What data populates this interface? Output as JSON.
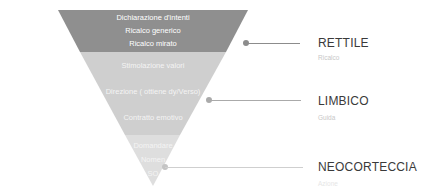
{
  "funnel": {
    "colors": {
      "top": "#8f8f8f",
      "middle": "#cfcfcf",
      "bottom": "#e2e2e2"
    },
    "top_items": [
      "Dichiarazione d'intenti",
      "Ricalco generico",
      "Ricalco mirato"
    ],
    "middle_items": [
      "Stimolazione valori",
      "Direzione ( ottiene dy/Verso)",
      "Contratto emotivo"
    ],
    "bottom_items": [
      "Domandare",
      "Nomen",
      "SO"
    ]
  },
  "layers": [
    {
      "title": "RETTILE",
      "subtitle": "Ricalco"
    },
    {
      "title": "LIMBICO",
      "subtitle": "Guida"
    },
    {
      "title": "NEOCORTECCIA",
      "subtitle": "Azione"
    }
  ],
  "connector_color": "#8c8c8c"
}
